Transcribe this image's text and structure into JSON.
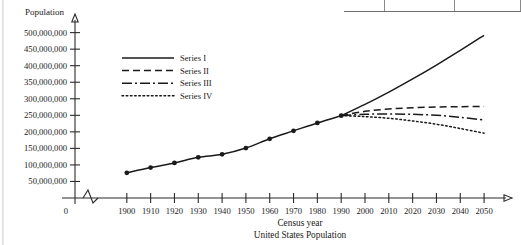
{
  "chart_data": {
    "type": "line",
    "title": "",
    "caption": "United States Population",
    "xlabel": "Census year",
    "ylabel": "Population",
    "grid": false,
    "legend_position": "upper-left-inside",
    "axis_break": true,
    "axis_break_label": "0",
    "xlim": [
      1890,
      2055
    ],
    "ylim": [
      0,
      520000000
    ],
    "ytick_step": 50000000,
    "ytick_labels": [
      "50,000,000",
      "100,000,000",
      "150,000,000",
      "200,000,000",
      "250,000,000",
      "300,000,000",
      "350,000,000",
      "400,000,000",
      "450,000,000",
      "500,000,000"
    ],
    "ytick_values": [
      50000000,
      100000000,
      150000000,
      200000000,
      250000000,
      300000000,
      350000000,
      400000000,
      450000000,
      500000000
    ],
    "xtick_labels": [
      "1900",
      "1910",
      "1920",
      "1930",
      "1940",
      "1950",
      "1960",
      "1970",
      "1980",
      "1990",
      "2000",
      "2010",
      "2020",
      "2030",
      "2040",
      "2050"
    ],
    "xtick_values": [
      1900,
      1910,
      1920,
      1930,
      1940,
      1950,
      1960,
      1970,
      1980,
      1990,
      2000,
      2010,
      2020,
      2030,
      2040,
      2050
    ],
    "historical": {
      "name": "Census data",
      "marker": "filled-circle",
      "x": [
        1900,
        1910,
        1920,
        1930,
        1940,
        1950,
        1960,
        1970,
        1980,
        1990
      ],
      "y": [
        76000000,
        92000000,
        106000000,
        123000000,
        132000000,
        151000000,
        179000000,
        203000000,
        227000000,
        249000000
      ]
    },
    "series": [
      {
        "name": "Series I",
        "style": "solid",
        "x": [
          1990,
          2000,
          2010,
          2020,
          2030,
          2040,
          2050
        ],
        "y": [
          249000000,
          283000000,
          320000000,
          360000000,
          402000000,
          446000000,
          492000000
        ]
      },
      {
        "name": "Series II",
        "style": "dashed",
        "x": [
          1990,
          2000,
          2010,
          2020,
          2030,
          2040,
          2050
        ],
        "y": [
          249000000,
          262000000,
          269000000,
          273000000,
          275000000,
          276000000,
          277000000
        ]
      },
      {
        "name": "Series III",
        "style": "dash-dot",
        "x": [
          1990,
          2000,
          2010,
          2020,
          2030,
          2040,
          2050
        ],
        "y": [
          249000000,
          253000000,
          254000000,
          253000000,
          250000000,
          244000000,
          236000000
        ]
      },
      {
        "name": "Series IV",
        "style": "dotted",
        "x": [
          1990,
          2000,
          2010,
          2020,
          2030,
          2040,
          2050
        ],
        "y": [
          249000000,
          246000000,
          241000000,
          233000000,
          223000000,
          210000000,
          196000000
        ]
      }
    ],
    "legend": [
      {
        "label": "Series I",
        "style": "solid"
      },
      {
        "label": "Series II",
        "style": "dashed"
      },
      {
        "label": "Series III",
        "style": "dash-dot"
      },
      {
        "label": "Series IV",
        "style": "dotted"
      }
    ]
  }
}
